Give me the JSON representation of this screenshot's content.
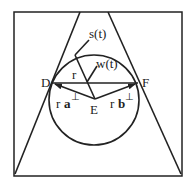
{
  "diagram": {
    "labels": {
      "D": "D",
      "F": "F",
      "E": "E",
      "s": "s(t)",
      "w": "w(t)",
      "r": "r",
      "ra_r": "r",
      "ra_a": "a",
      "ra_perp": "⊥",
      "rb_r": "r",
      "rb_b": "b",
      "rb_perp": "⊥"
    },
    "colors": {
      "line": "#222222",
      "background": "#ffffff"
    }
  }
}
